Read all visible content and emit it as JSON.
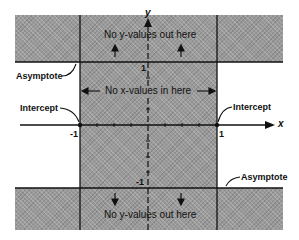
{
  "diagram": {
    "type": "graph-regions",
    "axes": {
      "x_label": "x",
      "y_label": "y"
    },
    "ticks": {
      "x_neg": "-1",
      "x_pos": "1",
      "y_pos": "1",
      "y_neg": "-1"
    },
    "regions": {
      "top_band": "No y-values out here",
      "center_strip": "No x-values in here",
      "bottom_band": "No y-values out here"
    },
    "callouts": {
      "asymptote_left": "Asymptote",
      "intercept_left": "Intercept",
      "intercept_right": "Intercept",
      "asymptote_right": "Asymptote"
    },
    "colors": {
      "shade": "#9a9a9a",
      "line": "#111111",
      "background": "#ffffff"
    }
  }
}
